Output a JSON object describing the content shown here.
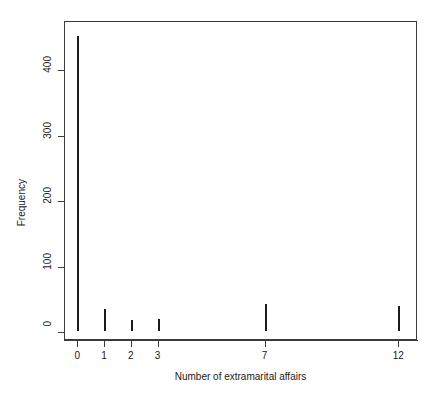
{
  "chart_data": {
    "type": "bar",
    "title": "",
    "xlabel": "Number of extramarital affairs",
    "ylabel": "Frequency",
    "categories": [
      "0",
      "1",
      "2",
      "3",
      "7",
      "12"
    ],
    "x": [
      0,
      1,
      2,
      3,
      7,
      12
    ],
    "values": [
      451,
      34,
      17,
      19,
      42,
      38
    ],
    "xlim": [
      -0.5,
      12.7
    ],
    "ylim": [
      0,
      475
    ],
    "x_ticks": [
      "0",
      "1",
      "2",
      "3",
      "7",
      "12"
    ],
    "x_tick_values": [
      0,
      1,
      2,
      3,
      7,
      12
    ],
    "y_ticks": [
      "0",
      "100",
      "200",
      "300",
      "400"
    ],
    "y_tick_values": [
      0,
      100,
      200,
      300,
      400
    ],
    "grid": false,
    "legend": null,
    "legend_position": "none",
    "bar_color": "#1c1c1c",
    "frame_color": "#3b3b3b",
    "background": "#ffffff"
  }
}
